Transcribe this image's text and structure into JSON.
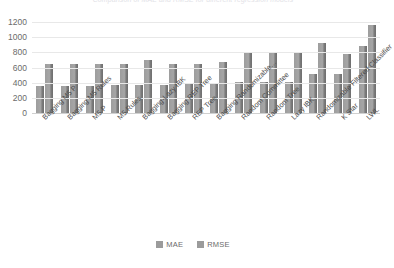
{
  "chart_data": {
    "type": "bar",
    "title": "Comparison of MAE and RMSE for different regression models",
    "xlabel": "",
    "ylabel": "",
    "ylim": [
      0,
      1200
    ],
    "yticks": [
      0,
      200,
      400,
      600,
      800,
      1000,
      1200
    ],
    "grid": true,
    "legend_position": "bottom",
    "categories": [
      "Bagging M5 P",
      "Bagging M5 Rules",
      "M5 P",
      "M5 Rules",
      "Bagging-Lazy IBK",
      "Bagging REP Tree",
      "REP Tree",
      "Bagging Randomizable…",
      "Random Committee",
      "Random Tree",
      "Lazy IBK",
      "Randomizable Filtered Classifier",
      "K Star",
      "LWL"
    ],
    "series": [
      {
        "name": "MAE",
        "color": "#9b9b9b",
        "values": [
          355,
          360,
          360,
          365,
          375,
          375,
          385,
          385,
          410,
          410,
          415,
          510,
          520,
          880
        ]
      },
      {
        "name": "RMSE",
        "color": "#9b9b9b",
        "values": [
          640,
          640,
          640,
          645,
          695,
          640,
          640,
          670,
          795,
          795,
          800,
          920,
          780,
          1165
        ]
      }
    ]
  }
}
